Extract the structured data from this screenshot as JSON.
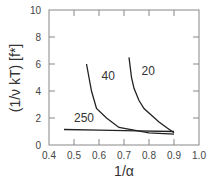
{
  "chart_data": {
    "type": "line",
    "title": "",
    "xlabel": "1/α",
    "ylabel": "(1/ν kT)  [f*]",
    "xlim": [
      0.4,
      1.0
    ],
    "ylim": [
      0,
      10
    ],
    "x_ticks": [
      "0.4",
      "0.5",
      "0.6",
      "0.7",
      "0.8",
      "0.9",
      "1.0"
    ],
    "y_ticks": [
      "0",
      "2",
      "4",
      "6",
      "8",
      "10"
    ],
    "grid": false,
    "legend": "inline curve labels",
    "series": [
      {
        "name": "40",
        "x": [
          0.55,
          0.57,
          0.59,
          0.63,
          0.68,
          0.74,
          0.8,
          0.9
        ],
        "y": [
          6.0,
          4.0,
          2.7,
          2.0,
          1.3,
          1.1,
          0.9,
          0.8
        ]
      },
      {
        "name": "20",
        "x": [
          0.72,
          0.73,
          0.74,
          0.76,
          0.78,
          0.81,
          0.84,
          0.87,
          0.9
        ],
        "y": [
          6.5,
          5.0,
          4.2,
          3.3,
          2.7,
          2.2,
          1.7,
          1.3,
          0.9
        ]
      },
      {
        "name": "250",
        "x": [
          0.46,
          0.6,
          0.75,
          0.9
        ],
        "y": [
          1.15,
          1.1,
          1.05,
          1.0
        ]
      }
    ],
    "annotations": [
      {
        "text": "40",
        "x": 0.61,
        "y": 4.8
      },
      {
        "text": "20",
        "x": 0.77,
        "y": 5.2
      },
      {
        "text": "250",
        "x": 0.5,
        "y": 1.7
      }
    ]
  }
}
